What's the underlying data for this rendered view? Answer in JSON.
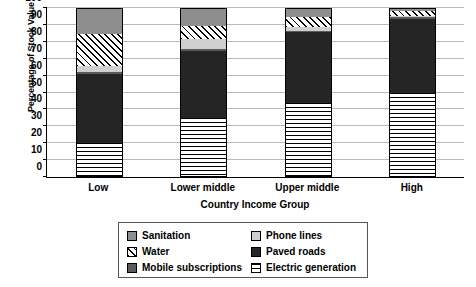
{
  "chart_data": {
    "type": "bar",
    "stacked": true,
    "title": "",
    "xlabel": "Country Income Group",
    "ylabel": "Percentage of Stock Value",
    "categories": [
      "Low",
      "Lower middle",
      "Upper middle",
      "High"
    ],
    "ylim": [
      0,
      100
    ],
    "yticks": [
      0,
      10,
      20,
      30,
      40,
      50,
      60,
      70,
      80,
      90,
      100
    ],
    "ytick_labels": [
      "0",
      "10",
      "20",
      "30",
      "40",
      "50",
      "60",
      "70",
      "80",
      "90",
      "100"
    ],
    "grid": true,
    "legend_position": "bottom",
    "stack_order_bottom_to_top": [
      "Electric generation",
      "Paved roads",
      "Mobile subscriptions",
      "Phone lines",
      "Water",
      "Sanitation"
    ],
    "series": [
      {
        "name": "Electric generation",
        "key": "electric",
        "color": "#ffffff",
        "pattern": "horizontal-lines",
        "values": [
          20,
          35,
          44,
          50
        ]
      },
      {
        "name": "Paved roads",
        "key": "paved",
        "color": "#252525",
        "pattern": "solid",
        "values": [
          41,
          40,
          42,
          44
        ]
      },
      {
        "name": "Mobile subscriptions",
        "key": "mobile",
        "color": "#5a5a5a",
        "pattern": "solid",
        "values": [
          1,
          1,
          1,
          1
        ]
      },
      {
        "name": "Phone lines",
        "key": "phone",
        "color": "#cfcfcf",
        "pattern": "solid",
        "values": [
          4,
          6,
          2,
          1
        ]
      },
      {
        "name": "Water",
        "key": "water",
        "color": "#ffffff",
        "pattern": "diagonal-hatch",
        "values": [
          19,
          8,
          6,
          3
        ]
      },
      {
        "name": "Sanitation",
        "key": "sanitation",
        "color": "#8e8e8e",
        "pattern": "solid",
        "values": [
          15,
          10,
          5,
          1
        ]
      }
    ],
    "cumulative_tops": {
      "Low": {
        "electric": 20,
        "paved": 61,
        "mobile": 62,
        "phone": 66,
        "water": 85,
        "sanitation": 100
      },
      "Lower middle": {
        "electric": 35,
        "paved": 75,
        "mobile": 76,
        "phone": 82,
        "water": 90,
        "sanitation": 100
      },
      "Upper middle": {
        "electric": 44,
        "paved": 86,
        "mobile": 87,
        "phone": 89,
        "water": 95,
        "sanitation": 100
      },
      "High": {
        "electric": 50,
        "paved": 94,
        "mobile": 95,
        "phone": 96,
        "water": 99,
        "sanitation": 100
      }
    }
  },
  "legend": {
    "left_column": [
      {
        "label": "Sanitation",
        "key": "sanitation"
      },
      {
        "label": "Water",
        "key": "water"
      },
      {
        "label": "Mobile subscriptions",
        "key": "mobile"
      }
    ],
    "right_column": [
      {
        "label": "Phone lines",
        "key": "phone"
      },
      {
        "label": "Paved roads",
        "key": "paved"
      },
      {
        "label": "Electric generation",
        "key": "electric"
      }
    ]
  }
}
